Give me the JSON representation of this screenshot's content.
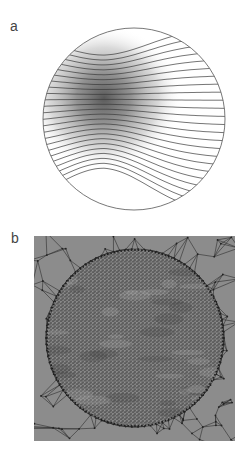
{
  "figure": {
    "panels": [
      {
        "id": "a",
        "label": "a",
        "description": "Circular domain with density gradient (dark blob upper-left) and horizontal streamlines that bunch and diverge around the dark region",
        "streamline_count": 24,
        "colors": {
          "outline": "#555555",
          "blob": "#4a4a4a",
          "background": "#ffffff"
        }
      },
      {
        "id": "b",
        "label": "b",
        "description": "Triangular mesh of square domain; fine mesh inside circle, coarse mesh outside",
        "colors": {
          "fill": "#8c8c8c",
          "edge": "#2e2e2e",
          "fine_fill": "#6e6e6e",
          "dot": "#d8d8d8"
        }
      }
    ]
  }
}
